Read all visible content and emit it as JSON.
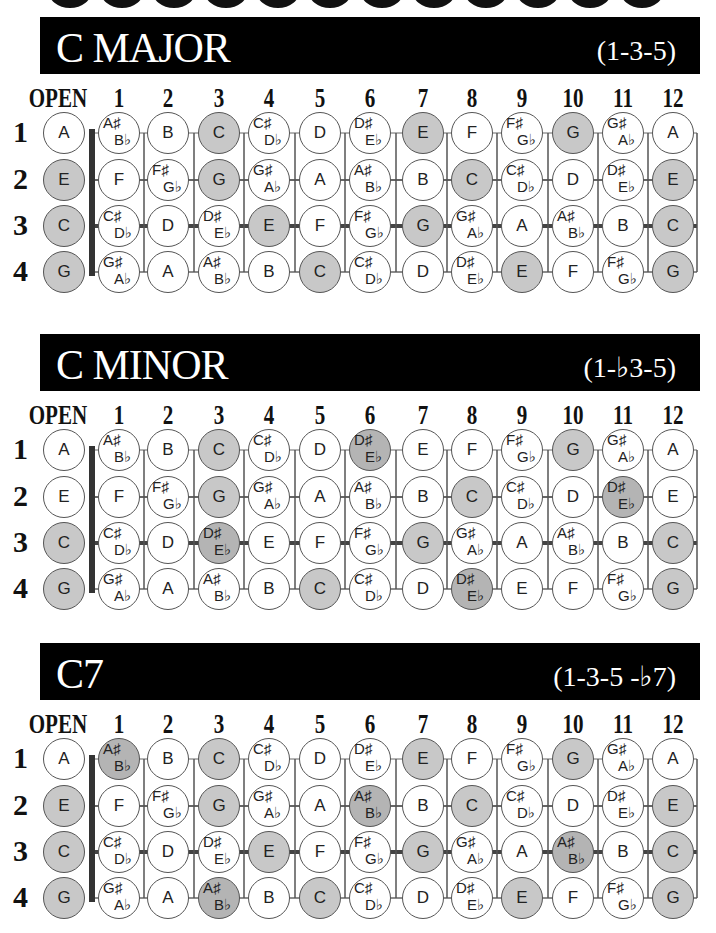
{
  "top_clipped_shapes": 12,
  "colors": {
    "banner_bg": "#000000",
    "banner_text": "#ffffff",
    "chord_tone": "#c8c8c8",
    "altered_tone": "#b4b4b4",
    "note_border": "#555555",
    "fret_line": "#555555",
    "nut": "#333333"
  },
  "fret_labels": [
    "OPEN",
    "1",
    "2",
    "3",
    "4",
    "5",
    "6",
    "7",
    "8",
    "9",
    "10",
    "11",
    "12"
  ],
  "string_labels": [
    "1",
    "2",
    "3",
    "4"
  ],
  "fretboard": [
    [
      "A",
      "A#/Bb",
      "B",
      "C",
      "C#/Db",
      "D",
      "D#/Eb",
      "E",
      "F",
      "F#/Gb",
      "G",
      "G#/Ab",
      "A"
    ],
    [
      "E",
      "F",
      "F#/Gb",
      "G",
      "G#/Ab",
      "A",
      "A#/Bb",
      "B",
      "C",
      "C#/Db",
      "D",
      "D#/Eb",
      "E"
    ],
    [
      "C",
      "C#/Db",
      "D",
      "D#/Eb",
      "E",
      "F",
      "F#/Gb",
      "G",
      "G#/Ab",
      "A",
      "A#/Bb",
      "B",
      "C"
    ],
    [
      "G",
      "G#/Ab",
      "A",
      "A#/Bb",
      "B",
      "C",
      "C#/Db",
      "D",
      "D#/Eb",
      "E",
      "F",
      "F#/Gb",
      "G"
    ]
  ],
  "sections": [
    {
      "title": "C MAJOR",
      "formula": "(1-3-5)",
      "highlight_notes": [
        "C",
        "E",
        "G"
      ],
      "altered_notes": []
    },
    {
      "title": "C MINOR",
      "formula": "(1-♭3-5)",
      "highlight_notes": [
        "C",
        "G"
      ],
      "altered_notes": [
        "D#/Eb"
      ]
    },
    {
      "title": "C7",
      "formula": "(1-3-5 -♭7)",
      "highlight_notes": [
        "C",
        "E",
        "G"
      ],
      "altered_notes": [
        "A#/Bb"
      ]
    }
  ]
}
